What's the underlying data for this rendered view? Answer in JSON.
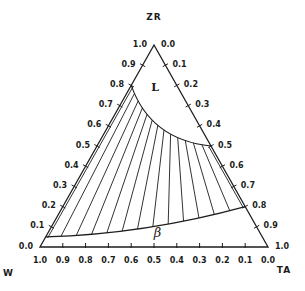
{
  "figure": {
    "background": "#ffffff",
    "ink": "#1c1c1c"
  },
  "chart_data": {
    "type": "ternary-phase-diagram",
    "title": "",
    "vertices": {
      "top": "ZR",
      "bottom_left": "W",
      "bottom_right": "TA"
    },
    "axis_ticks": [
      "0.0",
      "0.1",
      "0.2",
      "0.3",
      "0.4",
      "0.5",
      "0.6",
      "0.7",
      "0.8",
      "0.9",
      "1.0"
    ],
    "axes": {
      "left_edge": {
        "component": "ZR",
        "zero_at": "W corner",
        "one_at": "ZR apex",
        "tick_step": 0.1
      },
      "right_edge": {
        "component": "TA",
        "zero_at": "ZR apex",
        "one_at": "TA corner",
        "tick_step": 0.1
      },
      "bottom_edge": {
        "component": "W",
        "zero_at": "TA corner",
        "one_at": "W corner",
        "tick_step": 0.1
      }
    },
    "regions": [
      {
        "id": "L",
        "label": "L",
        "label_pos": {
          "zr": 0.79,
          "w": 0.1,
          "ta": 0.11
        }
      },
      {
        "id": "beta",
        "label": "β",
        "label_pos": {
          "zr": 0.07,
          "w": 0.45,
          "ta": 0.48
        }
      }
    ],
    "boundaries": [
      {
        "id": "liquidus",
        "from": {
          "zr": 0.8,
          "w": 0.2,
          "ta": 0.0
        },
        "ctrl": {
          "zr": 0.53,
          "w": 0.25,
          "ta": 0.22
        },
        "to": {
          "zr": 0.5,
          "w": 0.0,
          "ta": 0.5
        }
      },
      {
        "id": "beta_solvus",
        "from": {
          "zr": 0.05,
          "w": 0.95,
          "ta": 0.0
        },
        "ctrl": {
          "zr": 0.064,
          "w": 0.508,
          "ta": 0.428
        },
        "to": {
          "zr": 0.2,
          "w": 0.0,
          "ta": 0.8
        }
      }
    ],
    "tie_lines": {
      "count": 14,
      "from_boundary": "liquidus",
      "to_boundary": "beta_solvus"
    }
  }
}
